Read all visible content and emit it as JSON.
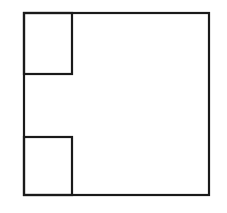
{
  "diagram": {
    "stroke_color": "#1a1a1a",
    "background": "#ffffff",
    "outer_square": {
      "x": 24,
      "y": 13,
      "w": 185,
      "h": 182
    },
    "corner_squares": [
      {
        "position": "top-left",
        "x": 24,
        "y": 13,
        "w": 48,
        "h": 61
      },
      {
        "position": "bottom-left",
        "x": 24,
        "y": 137,
        "w": 48,
        "h": 58
      }
    ]
  }
}
